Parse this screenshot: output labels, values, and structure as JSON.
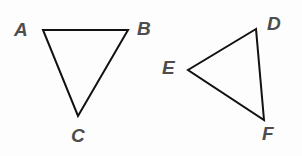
{
  "figure": {
    "background_color": "#fdfdfd",
    "stroke_color": "#111111",
    "stroke_width": 2,
    "label_color": "#4d4d4d",
    "shapes": [
      {
        "name": "triangle-abc",
        "type": "triangle",
        "points": "43,30 128,30 78,116",
        "vertices": [
          {
            "label": "A",
            "x": 43,
            "y": 30
          },
          {
            "label": "B",
            "x": 128,
            "y": 30
          },
          {
            "label": "C",
            "x": 78,
            "y": 116
          }
        ]
      },
      {
        "name": "triangle-def",
        "type": "triangle",
        "points": "256,29 188,70 264,120",
        "vertices": [
          {
            "label": "D",
            "x": 256,
            "y": 29
          },
          {
            "label": "E",
            "x": 188,
            "y": 70
          },
          {
            "label": "F",
            "x": 264,
            "y": 120
          }
        ]
      }
    ],
    "labels": {
      "a": "A",
      "b": "B",
      "c": "C",
      "d": "D",
      "e": "E",
      "f": "F"
    }
  }
}
